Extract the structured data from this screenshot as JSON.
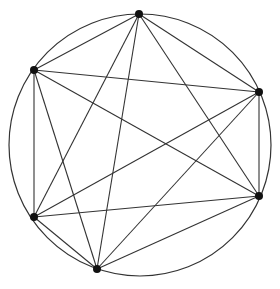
{
  "diagram": {
    "type": "complete-graph-inscribed-in-circle",
    "circle": {
      "cx": 140,
      "cy": 145,
      "r": 131
    },
    "colors": {
      "stroke": "#333333",
      "node": "#111111",
      "background": "#ffffff"
    },
    "nodes": [
      {
        "id": "A",
        "x": 139,
        "y": 14
      },
      {
        "id": "B",
        "x": 34,
        "y": 70
      },
      {
        "id": "C",
        "x": 259,
        "y": 92
      },
      {
        "id": "D",
        "x": 34,
        "y": 217
      },
      {
        "id": "E",
        "x": 97,
        "y": 269
      },
      {
        "id": "F",
        "x": 259,
        "y": 196
      }
    ],
    "edges": [
      [
        "A",
        "B"
      ],
      [
        "A",
        "C"
      ],
      [
        "A",
        "D"
      ],
      [
        "A",
        "E"
      ],
      [
        "A",
        "F"
      ],
      [
        "B",
        "C"
      ],
      [
        "B",
        "D"
      ],
      [
        "B",
        "E"
      ],
      [
        "B",
        "F"
      ],
      [
        "C",
        "D"
      ],
      [
        "C",
        "E"
      ],
      [
        "C",
        "F"
      ],
      [
        "D",
        "E"
      ],
      [
        "D",
        "F"
      ],
      [
        "E",
        "F"
      ]
    ]
  }
}
